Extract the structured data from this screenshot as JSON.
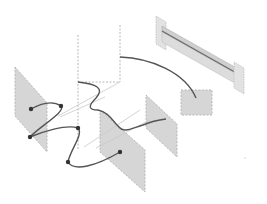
{
  "diagram": {
    "colors": {
      "background": "#ffffff",
      "panel_fill": "#d6d6d6",
      "panel_edge": "#b8b8b8",
      "curve": "#555555",
      "node": "#333333",
      "thin_line": "#c8c8c8",
      "beam_fill": "#dcdcdc",
      "beam_line": "#6a6a6a"
    },
    "panels": [
      {
        "id": "left-panel",
        "points": "15,67 47,103 47,152 15,116"
      },
      {
        "id": "middle-panel",
        "points": "100,110 145,150 145,192 100,152"
      },
      {
        "id": "right-panel",
        "points": "146,95 177,124 177,157 146,128"
      }
    ],
    "square": {
      "id": "small-square",
      "x": 181,
      "y": 90,
      "width": 31,
      "height": 25
    },
    "frame": {
      "id": "dashed-frame",
      "x": 78,
      "y": 35,
      "width": 42,
      "height": 47
    },
    "curve_path": "M 31 109 C 40 110, 52 95, 61 106 C 68 114, 40 128, 30 137 C 40 132, 68 120, 78 128 C 86 134, 70 150, 68 162 C 72 170, 90 170, 120 152",
    "zigzag_path": "M 78 82 C 96 84, 105 88, 96 98 C 88 106, 88 110, 98 110 C 108 112, 112 120, 118 126 C 124 134, 132 128, 143 125 C 150 122, 158 120, 166 119",
    "arc_path": "M 120 57 C 150 58, 185 72, 196 98",
    "nodes": [
      {
        "id": "node-1",
        "cx": 31,
        "cy": 109
      },
      {
        "id": "node-2",
        "cx": 61,
        "cy": 106
      },
      {
        "id": "node-3",
        "cx": 30,
        "cy": 137
      },
      {
        "id": "node-4",
        "cx": 78,
        "cy": 128
      },
      {
        "id": "node-5",
        "cx": 68,
        "cy": 162
      },
      {
        "id": "node-6",
        "cx": 120,
        "cy": 152
      }
    ],
    "thin_lines": [
      "M 60 117 L 105 97",
      "M 84 147 L 140 110",
      "M 96 148 L 150 120",
      "M 82 68 L 92 140"
    ]
  }
}
